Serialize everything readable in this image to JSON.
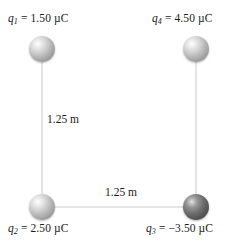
{
  "figure": {
    "background_color": "#ffffff",
    "edge_color": "#c9c9c9"
  },
  "charges": [
    {
      "id": "q1",
      "symbol": "q",
      "subscript": "1",
      "equals": " = ",
      "value": "1.50 µC",
      "full_label": "q₁ = 1.50 µC",
      "position": "top-left",
      "sphere_shade": "light",
      "sphere_color": "#b9b9b9",
      "cx": 42,
      "cy": 49
    },
    {
      "id": "q4",
      "symbol": "q",
      "subscript": "4",
      "equals": " = ",
      "value": "4.50 µC",
      "full_label": "q₄ = 4.50 µC",
      "position": "top-right",
      "sphere_shade": "light",
      "sphere_color": "#b9b9b9",
      "cx": 196,
      "cy": 49
    },
    {
      "id": "q2",
      "symbol": "q",
      "subscript": "2",
      "equals": " = ",
      "value": "2.50 µC",
      "full_label": "q₂ = 2.50 µC",
      "position": "bottom-left",
      "sphere_shade": "light",
      "sphere_color": "#b9b9b9",
      "cx": 42,
      "cy": 207
    },
    {
      "id": "q3",
      "symbol": "q",
      "subscript": "3",
      "equals": " = ",
      "value": "−3.50 µC",
      "full_label": "q₃ = −3.50 µC",
      "position": "bottom-right",
      "sphere_shade": "dark",
      "sphere_color": "#6f6f6f",
      "cx": 196,
      "cy": 207
    }
  ],
  "distances": [
    {
      "id": "left-side",
      "label": "1.25 m",
      "orientation": "vertical",
      "between": "q1-q2"
    },
    {
      "id": "bottom-side",
      "label": "1.25 m",
      "orientation": "horizontal",
      "between": "q2-q3"
    }
  ]
}
